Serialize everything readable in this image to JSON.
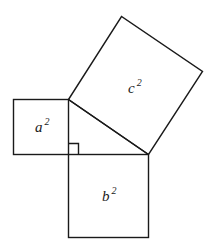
{
  "diagram": {
    "stroke_color": "#1a1a1a",
    "labels": {
      "a": {
        "base": "a",
        "exp": "2"
      },
      "b": {
        "base": "b",
        "exp": "2"
      },
      "c": {
        "base": "c",
        "exp": "2"
      }
    }
  }
}
